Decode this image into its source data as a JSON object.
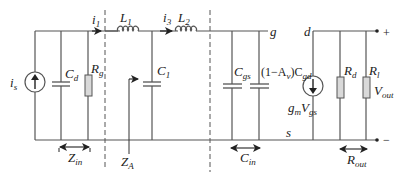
{
  "diagram": {
    "type": "small-signal equivalent circuit",
    "labels": {
      "source_current": {
        "main": "i",
        "sub": "s"
      },
      "i1": {
        "main": "i",
        "sub": "1"
      },
      "i3": {
        "main": "i",
        "sub": "3"
      },
      "L1": {
        "main": "L",
        "sub": "1"
      },
      "L2": {
        "main": "L",
        "sub": "2"
      },
      "Cd": {
        "main": "C",
        "sub": "d"
      },
      "Rg": {
        "main": "R",
        "sub": "g"
      },
      "C1": {
        "main": "C",
        "sub": "1"
      },
      "Cgs": {
        "main": "C",
        "sub": "gs"
      },
      "miller_cap": {
        "prefix": "(1−A",
        "prefix_sub": "v",
        "mid": ")C",
        "sub": "gd"
      },
      "gate": "g",
      "drain": "d",
      "source": "s",
      "gm_vgs": {
        "g": "g",
        "g_sub": "m",
        "v": "V",
        "v_sub": "gs"
      },
      "Rd": {
        "main": "R",
        "sub": "d"
      },
      "Rl": {
        "main": "R",
        "sub": "l"
      },
      "Vout": {
        "main": "V",
        "sub": "out"
      },
      "plus": "+",
      "minus": "−",
      "Zin": {
        "main": "Z",
        "sub": "in"
      },
      "ZA": {
        "main": "Z",
        "sub": "A"
      },
      "Cin": {
        "main": "C",
        "sub": "in"
      },
      "Rout": {
        "main": "R",
        "sub": "out"
      }
    },
    "colors": {
      "wire": "#555555",
      "resistor_fill": "#d9d9d9",
      "text": "#222222"
    }
  }
}
